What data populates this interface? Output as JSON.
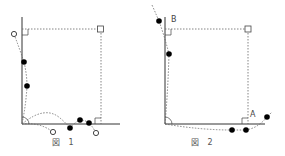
{
  "figures": [
    {
      "id": "figure-1",
      "caption": "図 1",
      "labels": [],
      "open_points": [
        [
          14,
          34
        ],
        [
          53,
          132
        ],
        [
          96,
          133
        ]
      ],
      "filled_points": [
        [
          24,
          62
        ],
        [
          27,
          86
        ],
        [
          70,
          128
        ],
        [
          80,
          120
        ],
        [
          89,
          123
        ]
      ]
    },
    {
      "id": "figure-2",
      "caption": "図 2",
      "labels": [
        {
          "text": "B",
          "x": 171,
          "y": 16
        },
        {
          "text": "A",
          "x": 250,
          "y": 111
        }
      ],
      "open_points": [],
      "filled_points": [
        [
          159,
          21
        ],
        [
          169,
          54
        ],
        [
          232,
          130
        ],
        [
          246,
          130
        ],
        [
          267,
          117
        ]
      ]
    }
  ],
  "colors": {
    "line": "#333333",
    "dotted": "#666666",
    "point": "#000000"
  }
}
